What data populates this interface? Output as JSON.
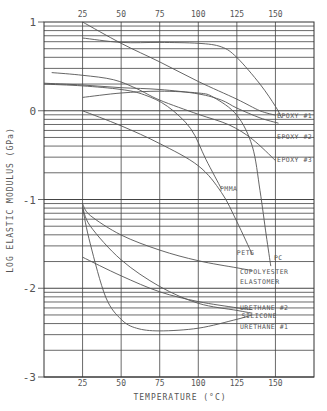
{
  "chart_data": {
    "type": "line",
    "title": "",
    "xlabel": "TEMPERATURE (°C)",
    "ylabel": "LOG ELASTIC MODULUS (GPa)",
    "xlim": [
      0,
      175
    ],
    "ylim": [
      -3,
      1
    ],
    "x_ticks": [
      25,
      50,
      75,
      100,
      125,
      150
    ],
    "x_tick_labels": [
      "25",
      "50",
      "75",
      "100",
      "125",
      "150"
    ],
    "y_ticks": [
      1,
      0,
      -1,
      -2,
      -3
    ],
    "y_tick_labels": [
      "1",
      "0",
      "-1",
      "-2",
      "-3"
    ],
    "grid": "log-scale horizontal lines per decade; vertical lines every 25 °C",
    "legend": "inline labels at right end of curves",
    "series": [
      {
        "name": "EPOXY #1",
        "points": [
          [
            25,
            0.82
          ],
          [
            50,
            0.77
          ],
          [
            75,
            0.77
          ],
          [
            100,
            0.76
          ],
          [
            115,
            0.72
          ],
          [
            125,
            0.6
          ],
          [
            140,
            0.3
          ],
          [
            150,
            0.05
          ],
          [
            154,
            -0.08
          ]
        ]
      },
      {
        "name": "EPOXY #2",
        "points": [
          [
            0,
            0.31
          ],
          [
            25,
            0.29
          ],
          [
            50,
            0.26
          ],
          [
            75,
            0.24
          ],
          [
            100,
            0.19
          ],
          [
            115,
            0.12
          ],
          [
            125,
            0.03
          ],
          [
            140,
            -0.08
          ],
          [
            152,
            -0.14
          ]
        ]
      },
      {
        "name": "EPOXY #3",
        "points": [
          [
            5,
            0.43
          ],
          [
            25,
            0.4
          ],
          [
            45,
            0.35
          ],
          [
            60,
            0.25
          ],
          [
            75,
            0.12
          ],
          [
            100,
            -0.04
          ],
          [
            120,
            -0.16
          ],
          [
            135,
            -0.32
          ],
          [
            150,
            -0.56
          ]
        ]
      },
      {
        "name": "",
        "points": [
          [
            25,
            1.0
          ],
          [
            50,
            0.76
          ],
          [
            75,
            0.55
          ],
          [
            100,
            0.33
          ],
          [
            125,
            0.13
          ],
          [
            140,
            0.0
          ],
          [
            150,
            -0.05
          ]
        ]
      },
      {
        "name": "PC",
        "points": [
          [
            25,
            0.15
          ],
          [
            50,
            0.2
          ],
          [
            75,
            0.22
          ],
          [
            100,
            0.2
          ],
          [
            110,
            0.15
          ],
          [
            125,
            -0.05
          ],
          [
            135,
            -0.4
          ],
          [
            140,
            -0.9
          ],
          [
            144,
            -1.4
          ],
          [
            147,
            -1.75
          ]
        ]
      },
      {
        "name": "PMMA",
        "points": [
          [
            0,
            0.3
          ],
          [
            25,
            0.28
          ],
          [
            50,
            0.24
          ],
          [
            65,
            0.18
          ],
          [
            80,
            0.05
          ],
          [
            95,
            -0.2
          ],
          [
            105,
            -0.55
          ],
          [
            115,
            -0.88
          ]
        ]
      },
      {
        "name": "PETG",
        "points": [
          [
            25,
            0.0
          ],
          [
            50,
            -0.17
          ],
          [
            75,
            -0.37
          ],
          [
            100,
            -0.62
          ],
          [
            115,
            -0.92
          ],
          [
            125,
            -1.25
          ],
          [
            135,
            -1.62
          ]
        ]
      },
      {
        "name": "COPOLYESTER ELASTOMER",
        "points": [
          [
            25,
            -1.05
          ],
          [
            30,
            -1.18
          ],
          [
            50,
            -1.4
          ],
          [
            75,
            -1.57
          ],
          [
            100,
            -1.69
          ],
          [
            125,
            -1.77
          ],
          [
            135,
            -1.8
          ]
        ]
      },
      {
        "name": "URETHANE #2",
        "points": [
          [
            25,
            -1.65
          ],
          [
            50,
            -1.86
          ],
          [
            75,
            -2.04
          ],
          [
            100,
            -2.15
          ],
          [
            125,
            -2.22
          ],
          [
            135,
            -2.24
          ]
        ]
      },
      {
        "name": "SILICONE",
        "points": [
          [
            25,
            -1.08
          ],
          [
            30,
            -1.3
          ],
          [
            50,
            -1.68
          ],
          [
            75,
            -1.98
          ],
          [
            100,
            -2.17
          ],
          [
            125,
            -2.25
          ],
          [
            135,
            -2.28
          ]
        ]
      },
      {
        "name": "URETHANE #1",
        "points": [
          [
            25,
            -1.1
          ],
          [
            30,
            -1.5
          ],
          [
            40,
            -2.1
          ],
          [
            50,
            -2.35
          ],
          [
            60,
            -2.45
          ],
          [
            75,
            -2.48
          ],
          [
            100,
            -2.45
          ],
          [
            125,
            -2.35
          ],
          [
            135,
            -2.3
          ]
        ]
      }
    ],
    "label_positions": [
      {
        "text": "EPOXY #1",
        "x": 151,
        "y": -0.08
      },
      {
        "text": "EPOXY #2",
        "x": 151,
        "y": -0.32
      },
      {
        "text": "EPOXY #3",
        "x": 151,
        "y": -0.58
      },
      {
        "text": "PMMA",
        "x": 114,
        "y": -0.9
      },
      {
        "text": "PETG",
        "x": 125,
        "y": -1.62
      },
      {
        "text": "PC",
        "x": 149,
        "y": -1.68
      },
      {
        "text": "COPOLYESTER",
        "x": 127,
        "y": -1.84
      },
      {
        "text": "ELASTOMER",
        "x": 127,
        "y": -1.95
      },
      {
        "text": "URETHANE #2",
        "x": 127,
        "y": -2.25
      },
      {
        "text": "SILICONE",
        "x": 128,
        "y": -2.34
      },
      {
        "text": "URETHANE #1",
        "x": 127,
        "y": -2.46
      }
    ]
  }
}
